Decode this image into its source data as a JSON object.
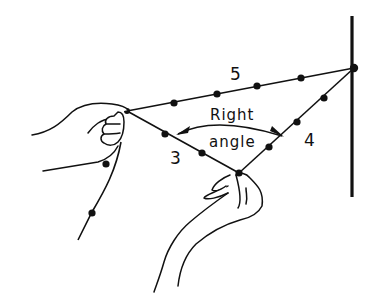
{
  "diagram": {
    "labels": {
      "side_hyp": "5",
      "side_short": "3",
      "side_long": "4",
      "angle_line1": "Right",
      "angle_line2": "angle"
    },
    "colors": {
      "ink": "#111111",
      "background": "#ffffff"
    }
  }
}
